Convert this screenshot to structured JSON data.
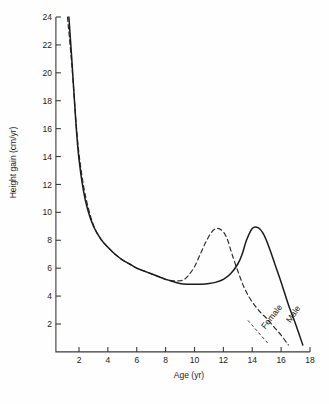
{
  "figure": {
    "background_color": "#fefefe",
    "ink_color": "#1b1b1b"
  },
  "chart_data": {
    "type": "line",
    "title": "",
    "subtitle": "",
    "xlabel": "Age (yr)",
    "ylabel": "Height gain (cm/yr)",
    "xlim": [
      0.4,
      18
    ],
    "ylim": [
      0,
      24
    ],
    "xticks": [
      2,
      4,
      6,
      8,
      10,
      12,
      14,
      16,
      18
    ],
    "yticks": [
      2,
      4,
      6,
      8,
      10,
      12,
      14,
      16,
      18,
      20,
      22,
      24
    ],
    "xtick_labels": [
      "2",
      "4",
      "6",
      "8",
      "10",
      "12",
      "14",
      "16",
      "18"
    ],
    "ytick_labels": [
      "2",
      "4",
      "6",
      "8",
      "10",
      "12",
      "14",
      "16",
      "18",
      "20",
      "22",
      "24"
    ],
    "grid": false,
    "legend_position": "inline-curve-labels",
    "annotations": [
      {
        "text": "Female",
        "series": "Female",
        "x": 15.5,
        "y": 2.4,
        "rotation": 52
      },
      {
        "text": "Male",
        "series": "Male",
        "x": 17.0,
        "y": 2.6,
        "rotation": 56
      }
    ],
    "series": [
      {
        "name": "Male",
        "style": "solid",
        "color": "#1b1b1b",
        "x": [
          1.3,
          1.5,
          1.8,
          2.0,
          2.3,
          2.6,
          3.0,
          3.5,
          4.0,
          4.5,
          5.0,
          5.5,
          6.0,
          6.5,
          7.0,
          7.5,
          8.0,
          8.5,
          9.0,
          9.5,
          10.0,
          10.5,
          11.0,
          11.5,
          12.0,
          12.5,
          13.0,
          13.3,
          13.6,
          14.0,
          14.4,
          14.8,
          15.2,
          15.6,
          16.0,
          16.5,
          17.0,
          17.5
        ],
        "y": [
          24.0,
          21.0,
          16.2,
          13.8,
          11.6,
          10.2,
          9.0,
          8.1,
          7.5,
          7.0,
          6.6,
          6.3,
          6.0,
          5.8,
          5.6,
          5.4,
          5.2,
          5.05,
          4.9,
          4.85,
          4.85,
          4.85,
          4.9,
          5.0,
          5.2,
          5.6,
          6.3,
          7.0,
          8.0,
          8.85,
          8.9,
          8.4,
          7.4,
          6.2,
          5.0,
          3.4,
          2.0,
          0.5
        ]
      },
      {
        "name": "Female",
        "style": "dashed",
        "color": "#2a2a2a",
        "x": [
          1.2,
          1.5,
          1.8,
          2.0,
          2.3,
          2.6,
          3.0,
          3.5,
          4.0,
          4.5,
          5.0,
          5.5,
          6.0,
          6.5,
          7.0,
          7.5,
          8.0,
          8.5,
          9.0,
          9.3,
          9.6,
          10.0,
          10.4,
          10.8,
          11.2,
          11.6,
          12.0,
          12.3,
          12.6,
          13.0,
          13.4,
          13.8,
          14.2,
          14.6,
          15.0,
          15.5,
          16.0,
          16.5
        ],
        "y": [
          24.0,
          20.6,
          16.4,
          14.2,
          12.0,
          10.5,
          9.1,
          8.1,
          7.5,
          7.0,
          6.6,
          6.3,
          6.0,
          5.8,
          5.6,
          5.4,
          5.2,
          5.1,
          5.1,
          5.2,
          5.5,
          6.1,
          7.0,
          7.9,
          8.6,
          8.85,
          8.6,
          8.0,
          7.0,
          5.8,
          4.7,
          3.9,
          3.3,
          2.8,
          2.4,
          1.8,
          1.2,
          0.5
        ]
      }
    ],
    "notes": {
      "peak_female_age": 11.6,
      "peak_female_value": 8.85,
      "peak_male_age": 14.1,
      "peak_male_value": 8.9,
      "trough_value": 4.85,
      "trough_age_range": [
        9.5,
        10.5
      ]
    }
  }
}
